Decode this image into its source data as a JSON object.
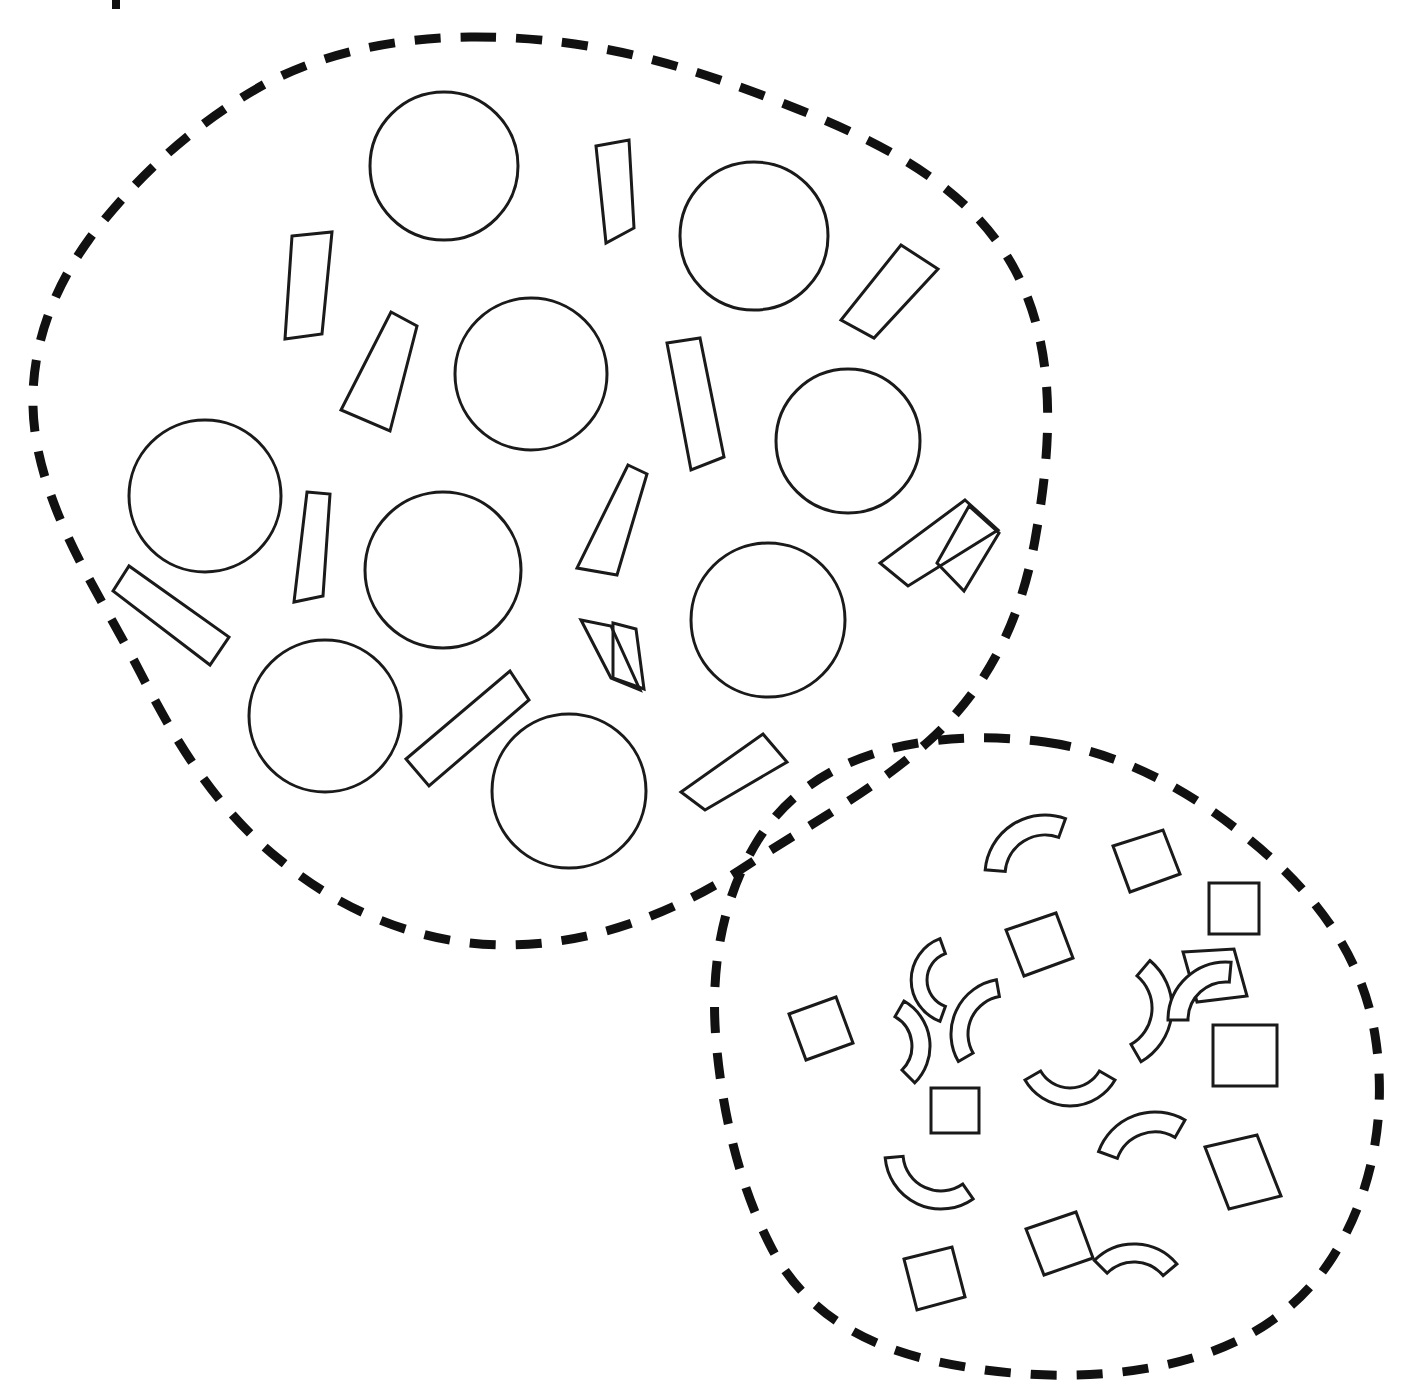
{
  "page": {
    "background_color": "#ffffff",
    "width": 1402,
    "height": 1394,
    "outline_color": "#111111",
    "shape_stroke_color": "#1a1a1a"
  },
  "regions": [
    {
      "id": "upper-left-region",
      "name": "upper-left-group",
      "boundary_style": "dashed-closed-curve",
      "contents_summary": "circles and elongated quadrilateral bars",
      "circle_count": 9,
      "bar_count": 14
    },
    {
      "id": "lower-right-region",
      "name": "lower-right-group",
      "boundary_style": "dashed-closed-curve",
      "contents_summary": "squares and curved arc bands",
      "square_count": 9,
      "arc_count": 10
    }
  ],
  "chart_data": {
    "type": "diagram",
    "groups": [
      {
        "name": "upper-left-group",
        "shape_kinds": [
          "circle",
          "bar"
        ],
        "counts": {
          "circle": 9,
          "bar": 14
        }
      },
      {
        "name": "lower-right-group",
        "shape_kinds": [
          "square",
          "arc"
        ],
        "counts": {
          "square": 9,
          "arc": 10
        }
      }
    ]
  },
  "geometry": {
    "blob_upper_path": "M 470 37 C 600 36 700 70 800 110 C 900 150 975 195 1015 270 C 1060 355 1050 455 1035 540 C 1020 625 985 690 930 740 C 875 790 800 830 740 870 C 670 915 590 945 505 945 C 420 945 340 910 280 860 C 215 808 175 740 140 672 C 100 595 55 530 38 450 C 22 372 45 300 90 238 C 140 172 200 120 265 84 C 330 50 400 38 470 37 Z",
    "blob_lower_path": "M 1045 742 C 1120 752 1190 790 1250 840 C 1315 893 1362 955 1375 1035 C 1388 1115 1372 1195 1332 1258 C 1292 1320 1230 1352 1160 1366 C 1085 1381 1005 1377 930 1360 C 855 1343 800 1305 770 1245 C 738 1182 722 1110 716 1040 C 710 968 722 898 758 840 C 795 782 855 752 925 742 C 965 736 1005 737 1045 742 Z",
    "crop_mark": {
      "x": 112,
      "y": 0,
      "width": 8,
      "height": 9
    },
    "circles": [
      {
        "cx": 444,
        "cy": 166,
        "r": 74
      },
      {
        "cx": 754,
        "cy": 236,
        "r": 74
      },
      {
        "cx": 531,
        "cy": 374,
        "r": 76
      },
      {
        "cx": 848,
        "cy": 441,
        "r": 72
      },
      {
        "cx": 205,
        "cy": 496,
        "r": 76
      },
      {
        "cx": 443,
        "cy": 570,
        "r": 78
      },
      {
        "cx": 768,
        "cy": 620,
        "r": 77
      },
      {
        "cx": 325,
        "cy": 716,
        "r": 76
      },
      {
        "cx": 569,
        "cy": 791,
        "r": 77
      }
    ],
    "bars": [
      {
        "points": "596,146 628,141 634,227 606,243",
        "label": "bar-1"
      },
      {
        "points": "291,237 331,233 321,333 285,338",
        "label": "bar-2"
      },
      {
        "points": "901,244 937,268 872,337 841,320"
      },
      {
        "points": "390,313 415,325 389,430 341,409"
      },
      {
        "points": "667,344 699,339 722,458 691,470"
      },
      {
        "points": "959,500 989,524 906,583 879,563"
      },
      {
        "points": "627,466 645,474 615,574 576,568"
      },
      {
        "points": "306,493 329,494 322,595 295,601"
      },
      {
        "points": "112,592 127,567 227,638 209,664"
      },
      {
        "points": "612,624 634,628 643,690 612,676"
      },
      {
        "points": "969,515 1000,537 909,584 884,562"
      },
      {
        "points": "508,672 527,699 428,784 405,759"
      },
      {
        "points": "762,735 785,761 704,809 680,793"
      },
      {
        "points": "584,622 634,630 641,688 614,679"
      }
    ],
    "squares": [
      {
        "points": "1113,844 1161,830 1177,874 1130,890"
      },
      {
        "points": "1210,883 1257,883 1257,931 1210,931"
      },
      {
        "points": "1007,930 1054,914 1070,958 1024,974"
      },
      {
        "points": "1183,953 1232,950 1244,995 1197,1001"
      },
      {
        "points": "789,1014 834,998 850,1042 804,1058"
      },
      {
        "points": "1214,1026 1274,1026 1274,1084 1214,1084"
      },
      {
        "points": "932,1088 977,1088 977,1131 932,1131"
      },
      {
        "points": "1206,1146 1255,1136 1278,1195 1228,1207"
      },
      {
        "points": "1027,1228 1074,1213 1090,1257 1044,1272"
      },
      {
        "points": "905,1258 951,1248 963,1297 917,1308"
      }
    ],
    "arcs": [
      {
        "cx": 1045,
        "cy": 875,
        "r_out": 60,
        "r_in": 40,
        "a0": 185,
        "a1": 290,
        "rot": 0
      },
      {
        "cx": 1110,
        "cy": 1008,
        "r_out": 62,
        "r_in": 42,
        "a0": 310,
        "a1": 60,
        "rot": 0
      },
      {
        "cx": 955,
        "cy": 980,
        "r_out": 44,
        "r_in": 28,
        "a0": 110,
        "a1": 250,
        "rot": 0
      },
      {
        "cx": 1226,
        "cy": 1020,
        "r_out": 58,
        "r_in": 38,
        "a0": 180,
        "a1": 275,
        "rot": 0
      },
      {
        "cx": 878,
        "cy": 1046,
        "r_out": 52,
        "r_in": 34,
        "a0": 300,
        "a1": 45,
        "rot": 0
      },
      {
        "cx": 1070,
        "cy": 1054,
        "r_out": 52,
        "r_in": 34,
        "a0": 30,
        "a1": 150,
        "rot": 0
      },
      {
        "cx": 941,
        "cy": 1153,
        "r_out": 56,
        "r_in": 38,
        "a0": 55,
        "a1": 175,
        "rot": 0
      },
      {
        "cx": 1155,
        "cy": 1172,
        "r_out": 60,
        "r_in": 40,
        "a0": 200,
        "a1": 300,
        "rot": 0
      },
      {
        "cx": 1134,
        "cy": 1300,
        "r_out": 56,
        "r_in": 38,
        "a0": 225,
        "a1": 320,
        "rot": 0
      },
      {
        "cx": 1006,
        "cy": 1034,
        "r_out": 55,
        "r_in": 38,
        "a0": 150,
        "a1": 260,
        "rot": 0
      }
    ]
  }
}
